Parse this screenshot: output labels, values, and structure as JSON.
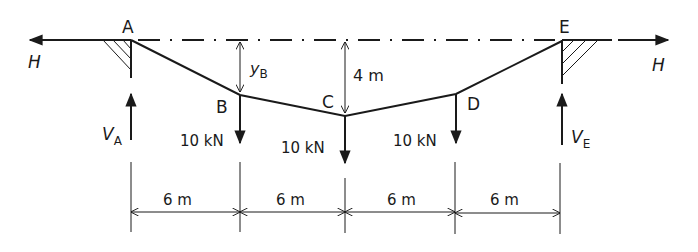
{
  "diagram": {
    "nodes": {
      "A": {
        "label": "A"
      },
      "B": {
        "label": "B"
      },
      "C": {
        "label": "C"
      },
      "D": {
        "label": "D"
      },
      "E": {
        "label": "E"
      }
    },
    "horizontal_force": {
      "left_label": "H",
      "right_label": "H"
    },
    "reactions": {
      "left": {
        "main": "V",
        "sub": "A"
      },
      "right": {
        "main": "V",
        "sub": "E"
      }
    },
    "loads": [
      {
        "node": "B",
        "label": "10 kN"
      },
      {
        "node": "C",
        "label": "10 kN"
      },
      {
        "node": "D",
        "label": "10 kN"
      }
    ],
    "sag_dimensions": {
      "at_B": {
        "main": "y",
        "sub": "B"
      },
      "at_C": {
        "label": "4 m"
      }
    },
    "spans": [
      {
        "label": "6 m"
      },
      {
        "label": "6 m"
      },
      {
        "label": "6 m"
      },
      {
        "label": "6 m"
      }
    ],
    "colors": {
      "line": "#1a1a1a",
      "background": "#ffffff"
    }
  }
}
